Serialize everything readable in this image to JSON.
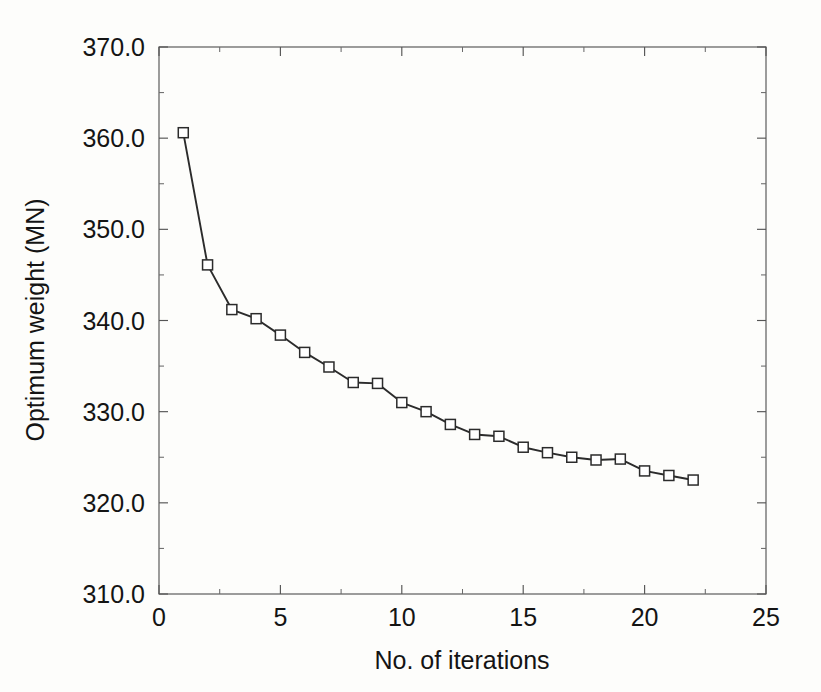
{
  "chart_data": {
    "type": "line",
    "title": "",
    "subtitle": "",
    "xlabel": "No. of iterations",
    "ylabel": "Optimum weight (MN)",
    "xlim": [
      0,
      25
    ],
    "ylim": [
      310.0,
      370.0
    ],
    "x_major_ticks": [
      0,
      5,
      10,
      15,
      20,
      25
    ],
    "x_major_tick_labels": [
      "0",
      "5",
      "10",
      "15",
      "20",
      "25"
    ],
    "x_minor_ticks": [
      2.5,
      7.5,
      12.5,
      17.5,
      22.5
    ],
    "y_major_ticks": [
      310.0,
      320.0,
      330.0,
      340.0,
      350.0,
      360.0,
      370.0
    ],
    "y_major_tick_labels": [
      "310.0",
      "320.0",
      "330.0",
      "340.0",
      "350.0",
      "360.0",
      "370.0"
    ],
    "y_minor_ticks": [
      315.0,
      325.0,
      335.0,
      345.0,
      355.0,
      365.0
    ],
    "grid": false,
    "legend": null,
    "legend_position": "none",
    "marker": "open-square",
    "line_color": "#2b2b2b",
    "marker_fill": "#ffffff",
    "marker_edge_color": "#2b2b2b",
    "background_color": "#fdfdfb",
    "axis_color": "#555555",
    "series": [
      {
        "name": "Optimum weight",
        "x": [
          1,
          2,
          3,
          4,
          5,
          6,
          7,
          8,
          9,
          10,
          11,
          12,
          13,
          14,
          15,
          16,
          17,
          18,
          19,
          20,
          21,
          22
        ],
        "values": [
          360.6,
          346.1,
          341.2,
          340.2,
          338.4,
          336.5,
          334.9,
          333.2,
          333.1,
          331.0,
          330.0,
          328.6,
          327.5,
          327.3,
          326.1,
          325.5,
          325.0,
          324.7,
          324.8,
          323.5,
          323.0,
          322.5
        ]
      }
    ]
  }
}
